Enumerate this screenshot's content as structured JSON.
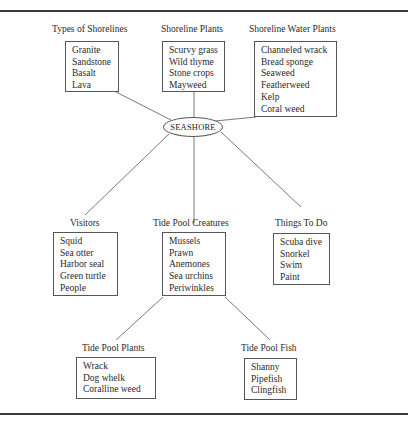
{
  "center": {
    "label": "SEASHORE"
  },
  "nodes": {
    "types_of_shorelines": {
      "title": "Types of Shorelines",
      "items": [
        "Granite",
        "Sandstone",
        "Basalt",
        "Lava"
      ]
    },
    "shoreline_plants": {
      "title": "Shoreline Plants",
      "items": [
        "Scurvy grass",
        "Wild thyme",
        "Stone crops",
        "Mayweed"
      ]
    },
    "shoreline_water_plants": {
      "title": "Shoreline Water Plants",
      "items": [
        "Channeled wrack",
        "Bread sponge",
        "Seaweed",
        "Featherweed",
        "Kelp",
        "Coral weed"
      ]
    },
    "visitors": {
      "title": "Visitors",
      "items": [
        "Squid",
        "Sea otter",
        "Harbor seal",
        "Green turtle",
        "People"
      ]
    },
    "tide_pool_creatures": {
      "title": "Tide Pool Creatures",
      "items": [
        "Mussels",
        "Prawn",
        "Anemones",
        "Sea urchins",
        "Periwinkles"
      ]
    },
    "things_to_do": {
      "title": "Things To Do",
      "items": [
        "Scuba dive",
        "Snorkel",
        "Swim",
        "Paint"
      ]
    },
    "tide_pool_plants": {
      "title": "Tide Pool Plants",
      "items": [
        "Wrack",
        "Dog whelk",
        "Coralline weed"
      ]
    },
    "tide_pool_fish": {
      "title": "Tide Pool Fish",
      "items": [
        "Shanny",
        "Pipefish",
        "Clingfish"
      ]
    }
  }
}
